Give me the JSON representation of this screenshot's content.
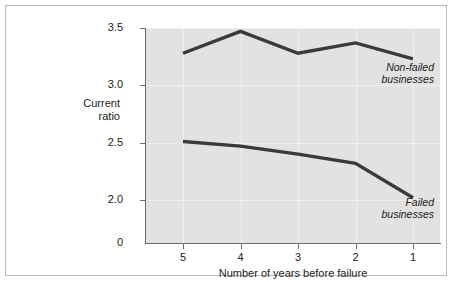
{
  "chart_data": {
    "type": "line",
    "title": "",
    "subtitle": "",
    "xlabel": "Number of years before failure",
    "ylabel": "Current ratio",
    "ylabel_line1": "Current",
    "ylabel_line2": "ratio",
    "categories": [
      "5",
      "4",
      "3",
      "2",
      "1"
    ],
    "x": [
      5,
      4,
      3,
      2,
      1
    ],
    "xlim": [
      5.35,
      0.65
    ],
    "x_inverted": true,
    "ylim": [
      1.78,
      3.58
    ],
    "y_axis_break": true,
    "yticks": [
      3.5,
      3.0,
      2.5,
      2.0,
      0
    ],
    "ytick_labels": [
      "3.5",
      "3.0",
      "2.5",
      "2.0",
      "0"
    ],
    "xtick_labels": [
      "5",
      "4",
      "3",
      "2",
      "1"
    ],
    "grid": true,
    "grid_color": "#f0f0f0",
    "plot_background": "#e2e2e2",
    "line_color": "#3a3a3a",
    "legend_position": "inline-annotation",
    "series": [
      {
        "name": "Non-failed businesses",
        "annotation_line1": "Non-failed",
        "annotation_line2": "businesses",
        "values": [
          3.28,
          3.47,
          3.28,
          3.37,
          3.23
        ]
      },
      {
        "name": "Failed businesses",
        "annotation_line1": "Failed",
        "annotation_line2": "businesses",
        "values": [
          2.51,
          2.47,
          2.4,
          2.32,
          2.02
        ]
      }
    ]
  },
  "axes": {
    "y": {
      "ticks": [
        {
          "label": "3.5",
          "value": 3.5
        },
        {
          "label": "3.0",
          "value": 3.0
        },
        {
          "label": "2.5",
          "value": 2.5
        },
        {
          "label": "2.0",
          "value": 2.0
        },
        {
          "label": "0",
          "value": 0
        }
      ]
    },
    "x": {
      "ticks": [
        {
          "label": "5",
          "value": 5
        },
        {
          "label": "4",
          "value": 4
        },
        {
          "label": "3",
          "value": 3
        },
        {
          "label": "2",
          "value": 2
        },
        {
          "label": "1",
          "value": 1
        }
      ]
    }
  }
}
